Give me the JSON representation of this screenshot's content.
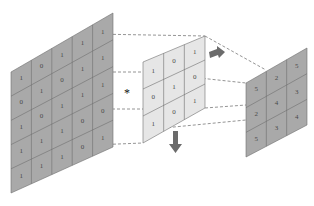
{
  "diagram": {
    "type": "2D convolution illustration",
    "operator_symbol": "*",
    "colors": {
      "input_fill": "#a9a9a9",
      "kernel_fill": "#e6e6e6",
      "output_fill": "#a9a9a9",
      "grid_line": "#6e6e6e",
      "dash_line": "#7a7a7a",
      "arrow_fill": "#6b6b6b"
    },
    "input": {
      "label": "input feature map",
      "rows": [
        [
          "1",
          "0",
          "1",
          "1",
          "1"
        ],
        [
          "0",
          "1",
          "0",
          "1",
          "1"
        ],
        [
          "1",
          "0",
          "1",
          "1",
          "1"
        ],
        [
          "1",
          "1",
          "1",
          "0",
          "0"
        ],
        [
          "1",
          "1",
          "1",
          "0",
          "1"
        ]
      ]
    },
    "kernel": {
      "label": "convolution kernel",
      "rows": [
        [
          "1",
          "0",
          "1"
        ],
        [
          "0",
          "1",
          "0"
        ],
        [
          "1",
          "0",
          "1"
        ]
      ]
    },
    "output": {
      "label": "output feature map",
      "rows": [
        [
          "5",
          "2",
          "5"
        ],
        [
          "2",
          "4",
          "3"
        ],
        [
          "5",
          "3",
          "4"
        ]
      ]
    },
    "arrows": [
      "slide-right-arrow",
      "slide-down-arrow"
    ]
  }
}
